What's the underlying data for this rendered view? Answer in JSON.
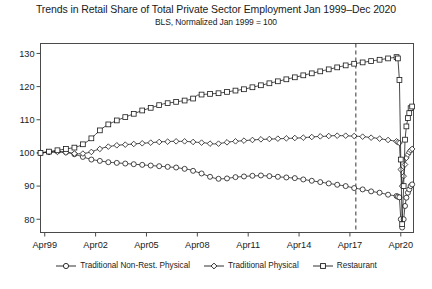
{
  "chart": {
    "title": "Trends in Retail Share of Total Private Sector Employment Jan 1999–Dec 2020",
    "subtitle": "BLS, Normalized Jan 1999 = 100"
  },
  "legend": {
    "items": [
      {
        "label": "Traditional Non-Rest. Physical",
        "marker": "circle"
      },
      {
        "label": "Traditional Physical",
        "marker": "diamond"
      },
      {
        "label": "Restaurant",
        "marker": "square"
      }
    ]
  },
  "axes": {
    "y_ticks": [
      "130",
      "120",
      "110",
      "100",
      "90",
      "80"
    ],
    "x_ticks": [
      "Apr99",
      "Apr02",
      "Apr05",
      "Apr08",
      "Apr11",
      "Apr14",
      "Apr17",
      "Apr20"
    ]
  },
  "chart_data": {
    "type": "line",
    "title": "Trends in Retail Share of Total Private Sector Employment Jan 1999–Dec 2020",
    "subtitle": "BLS, Normalized Jan 1999 = 100",
    "xlabel": "",
    "ylabel": "",
    "ylim": [
      76,
      133
    ],
    "xlim": [
      1999.0,
      2021.0
    ],
    "grid": false,
    "legend_position": "bottom",
    "x_tick_values": [
      1999.25,
      2002.25,
      2005.25,
      2008.25,
      2011.25,
      2014.25,
      2017.25,
      2020.25
    ],
    "x_tick_labels": [
      "Apr99",
      "Apr02",
      "Apr05",
      "Apr08",
      "Apr11",
      "Apr14",
      "Apr17",
      "Apr20"
    ],
    "y_tick_values": [
      130,
      120,
      110,
      100,
      90,
      80
    ],
    "y_tick_labels": [
      "130",
      "120",
      "110",
      "100",
      "90",
      "80"
    ],
    "annotations": [
      {
        "type": "vertical-dashed-line",
        "x": 2017.6,
        "label": ""
      }
    ],
    "x": [
      1999.0,
      1999.25,
      1999.5,
      1999.75,
      2000.0,
      2000.25,
      2000.5,
      2000.75,
      2001.0,
      2001.25,
      2001.5,
      2001.75,
      2002.0,
      2002.25,
      2002.5,
      2002.75,
      2003.0,
      2003.25,
      2003.5,
      2003.75,
      2004.0,
      2004.25,
      2004.5,
      2004.75,
      2005.0,
      2005.25,
      2005.5,
      2005.75,
      2006.0,
      2006.25,
      2006.5,
      2006.75,
      2007.0,
      2007.25,
      2007.5,
      2007.75,
      2008.0,
      2008.25,
      2008.5,
      2008.75,
      2009.0,
      2009.25,
      2009.5,
      2009.75,
      2010.0,
      2010.25,
      2010.5,
      2010.75,
      2011.0,
      2011.25,
      2011.5,
      2011.75,
      2012.0,
      2012.25,
      2012.5,
      2012.75,
      2013.0,
      2013.25,
      2013.5,
      2013.75,
      2014.0,
      2014.25,
      2014.5,
      2014.75,
      2015.0,
      2015.25,
      2015.5,
      2015.75,
      2016.0,
      2016.25,
      2016.5,
      2016.75,
      2017.0,
      2017.25,
      2017.5,
      2017.75,
      2018.0,
      2018.25,
      2018.5,
      2018.75,
      2019.0,
      2019.25,
      2019.5,
      2019.75,
      2020.0,
      2020.08,
      2020.17,
      2020.25,
      2020.33,
      2020.42,
      2020.5,
      2020.58,
      2020.67,
      2020.75,
      2020.83,
      2020.92
    ],
    "series": [
      {
        "name": "Traditional Non-Rest. Physical",
        "marker": "circle",
        "values": [
          100.0,
          100.2,
          100.3,
          100.4,
          100.5,
          100.4,
          100.2,
          100.0,
          99.6,
          99.2,
          98.8,
          98.4,
          98.0,
          97.8,
          97.6,
          97.4,
          97.2,
          97.1,
          97.0,
          96.9,
          96.8,
          96.7,
          96.6,
          96.5,
          96.4,
          96.3,
          96.2,
          96.1,
          96.0,
          95.9,
          95.8,
          95.7,
          95.6,
          95.4,
          95.2,
          95.0,
          94.6,
          94.2,
          93.8,
          93.3,
          92.8,
          92.4,
          92.2,
          92.2,
          92.3,
          92.5,
          92.7,
          92.8,
          92.9,
          93.0,
          93.1,
          93.1,
          93.2,
          93.1,
          93.0,
          92.9,
          92.8,
          92.7,
          92.6,
          92.5,
          92.4,
          92.2,
          92.0,
          91.8,
          91.6,
          91.4,
          91.2,
          91.0,
          90.8,
          90.6,
          90.4,
          90.2,
          90.0,
          89.7,
          89.4,
          89.2,
          89.0,
          88.7,
          88.4,
          88.2,
          88.0,
          87.7,
          87.4,
          87.2,
          87.0,
          86.8,
          86.6,
          80.0,
          77.5,
          80.0,
          84.0,
          86.5,
          88.0,
          89.0,
          90.0,
          90.5
        ]
      },
      {
        "name": "Traditional Physical",
        "marker": "diamond",
        "values": [
          100.0,
          100.1,
          100.2,
          100.2,
          100.3,
          100.2,
          100.1,
          100.0,
          99.8,
          99.7,
          99.8,
          100.0,
          100.3,
          100.8,
          101.2,
          101.6,
          101.9,
          102.1,
          102.3,
          102.4,
          102.5,
          102.6,
          102.7,
          102.8,
          102.9,
          103.0,
          103.1,
          103.2,
          103.3,
          103.4,
          103.4,
          103.5,
          103.5,
          103.5,
          103.5,
          103.4,
          103.3,
          103.2,
          103.1,
          103.0,
          102.8,
          102.7,
          102.8,
          103.0,
          103.2,
          103.4,
          103.5,
          103.6,
          103.7,
          103.8,
          103.9,
          104.0,
          104.1,
          104.1,
          104.2,
          104.2,
          104.3,
          104.3,
          104.4,
          104.4,
          104.5,
          104.5,
          104.6,
          104.7,
          104.8,
          104.9,
          105.0,
          105.0,
          105.1,
          105.2,
          105.2,
          105.2,
          105.2,
          105.1,
          105.1,
          105.0,
          104.9,
          104.8,
          104.6,
          104.5,
          104.3,
          104.1,
          103.9,
          103.7,
          103.5,
          103.2,
          103.0,
          95.0,
          90.0,
          93.0,
          96.5,
          98.5,
          99.5,
          100.2,
          100.8,
          101.2
        ]
      },
      {
        "name": "Restaurant",
        "marker": "square",
        "values": [
          100.0,
          100.2,
          100.4,
          100.6,
          100.8,
          101.0,
          101.2,
          101.4,
          101.6,
          102.0,
          102.6,
          103.4,
          104.4,
          105.6,
          106.8,
          107.8,
          108.6,
          109.2,
          109.8,
          110.3,
          110.8,
          111.3,
          111.8,
          112.3,
          112.8,
          113.2,
          113.6,
          114.0,
          114.4,
          114.8,
          115.0,
          115.2,
          115.4,
          115.6,
          115.8,
          116.0,
          116.4,
          117.4,
          117.6,
          117.7,
          117.8,
          117.9,
          118.0,
          118.2,
          118.4,
          118.6,
          118.8,
          119.0,
          119.2,
          119.5,
          119.8,
          120.1,
          120.4,
          120.7,
          121.0,
          121.3,
          121.6,
          121.9,
          122.2,
          122.5,
          122.8,
          123.1,
          123.4,
          123.7,
          124.0,
          124.3,
          124.6,
          124.9,
          125.2,
          125.5,
          125.8,
          126.1,
          126.4,
          126.7,
          126.9,
          127.1,
          127.3,
          127.5,
          127.7,
          127.9,
          128.1,
          128.3,
          128.5,
          128.7,
          128.9,
          128.5,
          122.0,
          98.0,
          78.5,
          90.0,
          104.0,
          108.0,
          110.5,
          112.0,
          113.5,
          114.0
        ]
      }
    ]
  }
}
